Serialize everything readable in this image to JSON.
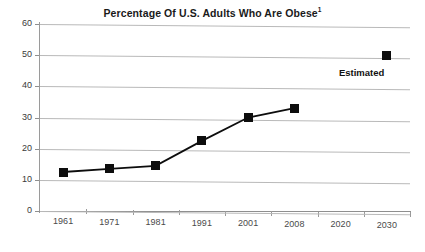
{
  "chart_data": {
    "type": "line",
    "title": "Percentage Of U.S. Adults Who Are Obese",
    "title_superscript": "1",
    "xlabel": "",
    "ylabel": "",
    "categories": [
      "1961",
      "1971",
      "1981",
      "1991",
      "2001",
      "2008",
      "2020",
      "2030"
    ],
    "series": [
      {
        "name": "Percentage of U.S. adults who are obese",
        "values": [
          12.5,
          13.5,
          14.5,
          22.5,
          30,
          33,
          null,
          50
        ]
      }
    ],
    "ylim": [
      0,
      60
    ],
    "y_ticks": [
      "0",
      "10",
      "20",
      "30",
      "40",
      "50",
      "60"
    ],
    "grid": true,
    "legend": "none",
    "annotations": [
      {
        "text": "Estimated",
        "at_category": "2030",
        "note": "bold label beneath the 2030 estimated data point"
      }
    ],
    "marker_style": "filled-square",
    "colors": {
      "series_line": "#0d0d0d",
      "marker": "#0d0d0d",
      "gridline": "#b9b9b9",
      "axis": "#8f8f8f",
      "text": "#1a1a1a",
      "background": "#ffffff"
    }
  }
}
